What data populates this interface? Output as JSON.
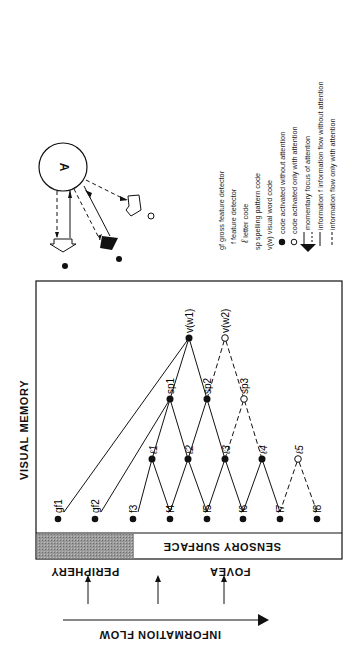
{
  "diagram": {
    "title": "VISUAL MEMORY",
    "sensory_surface_label": "SENSORY SURFACE",
    "periphery_label": "PERIPHERY",
    "fovea_label": "FOVEA",
    "information_flow_label": "INFORMATION FLOW",
    "attention_label": "A",
    "nodes": {
      "gf1": "gf1",
      "gf2": "gf2",
      "f3": "f3",
      "f4": "f4",
      "f5": "f5",
      "f6": "f6",
      "f7": "f7",
      "f8": "f8",
      "l1": "ℓ1",
      "l2": "ℓ2",
      "l3": "ℓ3",
      "l4": "ℓ4",
      "l5": "ℓ5",
      "sp1": "sp1",
      "sp2": "sp2",
      "sp3": "sp3",
      "vw1": "v(w1)",
      "vw2": "v(w2)"
    }
  },
  "legend": {
    "items": [
      {
        "symbol": "gf",
        "text": "gross feature detector"
      },
      {
        "symbol": "f",
        "text": "feature detector"
      },
      {
        "symbol": "ℓ",
        "text": "letter code"
      },
      {
        "symbol": "sp",
        "text": "spelling pattern code"
      },
      {
        "symbol": "v(w)",
        "text": "visual word code"
      },
      {
        "symbol": "filled-circle",
        "text": "code activated without attention"
      },
      {
        "symbol": "hollow-circle",
        "text": "code activated only with attention"
      },
      {
        "symbol": "hollow-arrow",
        "text": "momentary focus of attention"
      },
      {
        "symbol": "solid-line",
        "text": "information flow without attention"
      },
      {
        "symbol": "dashed-line",
        "text": "information flow only with attention"
      }
    ]
  }
}
